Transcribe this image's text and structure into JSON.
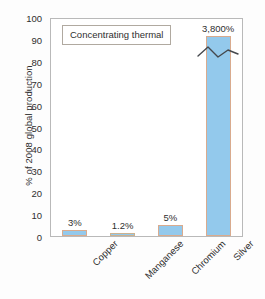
{
  "chart_data": {
    "type": "bar",
    "title": "Concentrating thermal",
    "xlabel": "",
    "ylabel": "% of 2008 global production",
    "categories": [
      "Copper",
      "Manganese",
      "Chromium",
      "Silver"
    ],
    "values": [
      3,
      1.2,
      5,
      3800
    ],
    "value_labels": [
      "3%",
      "1.2%",
      "5%",
      "3,800%"
    ],
    "plotted_heights": [
      3,
      1.2,
      5,
      92
    ],
    "axis_broken_series": [
      "Silver"
    ],
    "ylim": [
      0,
      100
    ],
    "yticks": [
      0,
      10,
      20,
      30,
      40,
      50,
      60,
      70,
      80,
      90,
      100
    ],
    "ytick_labels": [
      "0",
      "10",
      "20",
      "30",
      "40",
      "50",
      "60",
      "70",
      "80",
      "90",
      "100"
    ],
    "grid": false,
    "legend": false,
    "legend_position": "none",
    "annotations": [
      "axis break zigzag on Silver bar"
    ],
    "colors": {
      "bar_fill": "#93c9ec",
      "bar_edge": "#d9ab8e",
      "frame": "#b9b9b9",
      "text": "#2f2f2f",
      "background": "#ffffff"
    }
  }
}
